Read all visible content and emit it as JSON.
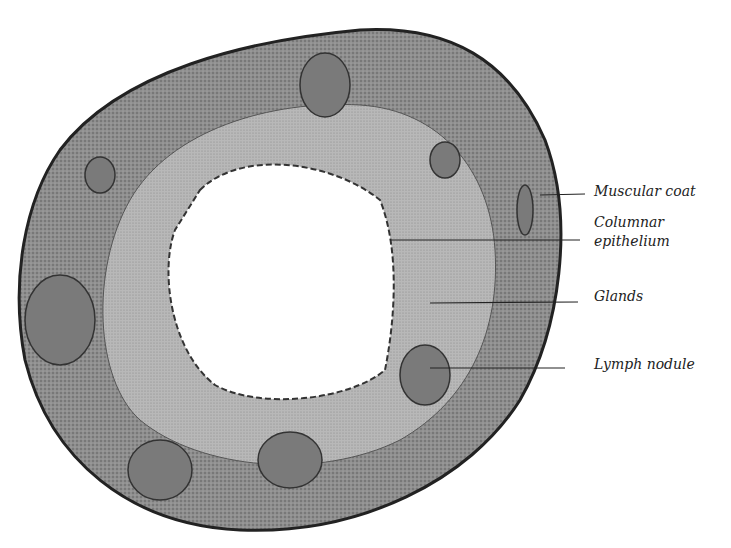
{
  "figure": {
    "labels": {
      "muscular_coat": "Muscular coat",
      "columnar_epithelium_1": "Columnar",
      "columnar_epithelium_2": "epithelium",
      "glands": "Glands",
      "lymph_nodule": "Lymph nodule"
    },
    "colors": {
      "ink": "#222222",
      "tissue_dark": "#6a6a6a",
      "tissue_mid": "#9a9a9a",
      "tissue_light": "#c8c8c8",
      "lumen": "#ffffff"
    }
  }
}
